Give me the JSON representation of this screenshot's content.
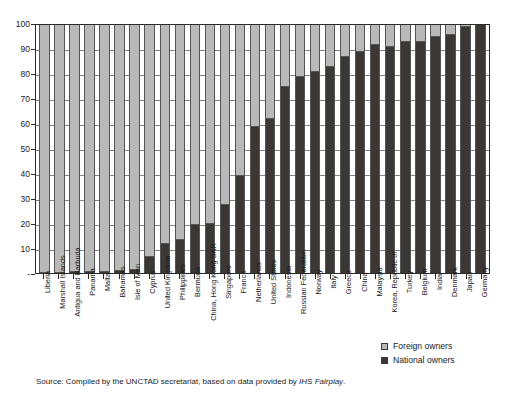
{
  "chart_data": {
    "type": "bar",
    "stacked": true,
    "title": "",
    "subtitle": "",
    "xlabel": "",
    "ylabel": "",
    "ylim": [
      0,
      100
    ],
    "yticks": [
      "-",
      "10",
      "20",
      "30",
      "40",
      "50",
      "60",
      "70",
      "80",
      "90",
      "100"
    ],
    "grid": true,
    "legend_position": "bottom-right",
    "categories": [
      "Liberia",
      "Marshall Islands",
      "Antigua and Barbuda",
      "Panama",
      "Malta",
      "Bahamas",
      "Isle of Man",
      "Cyprus",
      "United Kingdom",
      "Philippines",
      "Bermuda",
      "China, Hong Kong SAR",
      "Singapore",
      "France",
      "Netherlands",
      "United States",
      "Indonesia",
      "Russian Federation",
      "Norway",
      "Italy",
      "Greece",
      "China",
      "Malaysia",
      "Korea, Republic of",
      "Turkey",
      "Belgium",
      "India",
      "Denmark",
      "Japan",
      "Germany"
    ],
    "series": [
      {
        "name": "National owners",
        "color": "#3b3734",
        "values": [
          0,
          0,
          0.3,
          0.4,
          0.5,
          1,
          1.4,
          6.5,
          11.5,
          13.5,
          19.5,
          19.8,
          27.5,
          39,
          59,
          62,
          75,
          79,
          81,
          83,
          87,
          89,
          92,
          91,
          93,
          93,
          95,
          96,
          99,
          100
        ]
      },
      {
        "name": "Foreign owners",
        "color": "#b9b9b9",
        "values": [
          100,
          100,
          99.7,
          99.6,
          99.5,
          99,
          98.6,
          93.5,
          88.5,
          86.5,
          80.5,
          80.2,
          72.5,
          61,
          41,
          38,
          25,
          21,
          19,
          17,
          13,
          11,
          8,
          9,
          7,
          7,
          5,
          4,
          1,
          0
        ]
      }
    ]
  },
  "legend": {
    "items": [
      {
        "label": "Foreign owners",
        "swatch": "foreign"
      },
      {
        "label": "National owners",
        "swatch": "national"
      }
    ]
  },
  "source": {
    "prefix": "Source: Compiled by the UNCTAD secretariat, based on data provided by ",
    "italic": "IHS Fairplay",
    "suffix": "."
  }
}
